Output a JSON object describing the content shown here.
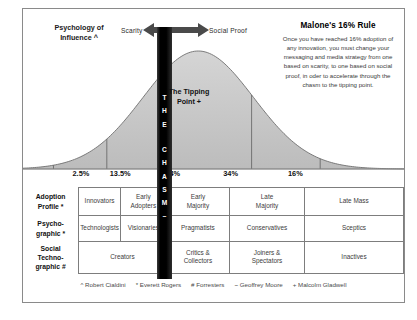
{
  "header": {
    "left_label": "Psychology of\nInfluence ^",
    "scarcity_label": "Scarity",
    "social_proof_label": "Social Proof"
  },
  "callout": {
    "title": "Malone's 16% Rule",
    "body": "Once you have reached 16% adoption of any innovation, you must change your messaging and media strategy from one based on scarity, to one based on social proof, in oder to accelerate through the chasm to the tipping point."
  },
  "chasm": {
    "letters": [
      "T",
      "H",
      "E",
      "",
      "C",
      "H",
      "A",
      "S",
      "M",
      "~"
    ]
  },
  "tipping_point": {
    "label": "The Tipping\nPoint +"
  },
  "chart_data": {
    "type": "area",
    "categories": [
      "Innovators",
      "Early Adopters",
      "Early Majority",
      "Late Majority",
      "Late Mass"
    ],
    "values": [
      2.5,
      13.5,
      34,
      34,
      16
    ],
    "value_labels": [
      "2.5%",
      "13.5%",
      "34%",
      "34%",
      "16%"
    ],
    "xlabel": "",
    "ylabel": "",
    "grid": false,
    "legend": "none",
    "curve_fill": "#c9c9c9",
    "curve_stroke": "#6b6b6b",
    "boundaries_pct": [
      0.08,
      0.22,
      0.38,
      0.6,
      0.78
    ]
  },
  "table": {
    "rows": [
      {
        "label": "Adoption\nProfile *",
        "cells": [
          {
            "text": "Innovators",
            "span": 2
          },
          {
            "text": "Early\nAdopters",
            "span": 1
          },
          {
            "text": "Early\nMajority",
            "span": 1
          },
          {
            "text": "Late\nMajority",
            "span": 1
          },
          {
            "text": "Late Mass",
            "span": 1
          }
        ]
      },
      {
        "label": "Psycho-\ngraphic *",
        "cells": [
          {
            "text": "Technologists",
            "span": 2
          },
          {
            "text": "Visionaries",
            "span": 1
          },
          {
            "text": "Pragmatists",
            "span": 1
          },
          {
            "text": "Conservatives",
            "span": 1
          },
          {
            "text": "Sceptics",
            "span": 1
          }
        ]
      },
      {
        "label": "Social\nTechno-\ngraphic #",
        "cells": [
          {
            "text": "Creators",
            "span": 3
          },
          {
            "text": "",
            "span": 0
          },
          {
            "text": "Critics &\nCollectors",
            "span": 1
          },
          {
            "text": "Joiners &\nSpectators",
            "span": 1
          },
          {
            "text": "Inactives",
            "span": 1
          }
        ]
      }
    ]
  },
  "footnotes": [
    "^ Robert Cialdini",
    "* Everett Rogers",
    "# Forresters",
    "~ Geoffrey Moore",
    "+ Malcolm Gladwell"
  ]
}
